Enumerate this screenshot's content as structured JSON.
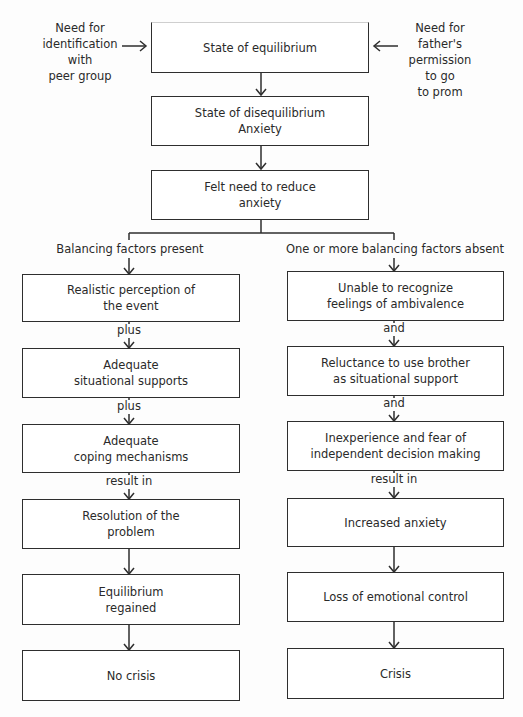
{
  "diagram": {
    "type": "flowchart",
    "inputs": {
      "left": [
        "Need for",
        "identification",
        "with",
        "peer group"
      ],
      "right": [
        "Need for",
        "father's",
        "permission",
        "to go",
        "to prom"
      ]
    },
    "center": [
      {
        "id": "equilibrium",
        "lines": [
          "State of equilibrium"
        ]
      },
      {
        "id": "disequilibrium",
        "lines": [
          "State of disequilibrium",
          "Anxiety"
        ]
      },
      {
        "id": "felt-need",
        "lines": [
          "Felt need to reduce",
          "anxiety"
        ]
      }
    ],
    "branches": {
      "left": {
        "label": "Balancing factors present",
        "boxes": [
          [
            "Realistic perception of",
            "the event"
          ],
          [
            "Adequate",
            "situational supports"
          ],
          [
            "Adequate",
            "coping mechanisms"
          ],
          [
            "Resolution of the",
            "problem"
          ],
          [
            "Equilibrium",
            "regained"
          ],
          [
            "No crisis"
          ]
        ],
        "connectors": [
          "plus",
          "plus",
          "result in",
          "",
          ""
        ]
      },
      "right": {
        "label": "One or more balancing factors absent",
        "boxes": [
          [
            "Unable to recognize",
            "feelings of ambivalence"
          ],
          [
            "Reluctance to use brother",
            "as situational support"
          ],
          [
            "Inexperience and fear of",
            "independent decision making"
          ],
          [
            "Increased anxiety"
          ],
          [
            "Loss of emotional control"
          ],
          [
            "Crisis"
          ]
        ],
        "connectors": [
          "and",
          "and",
          "result in",
          "",
          ""
        ]
      }
    }
  }
}
